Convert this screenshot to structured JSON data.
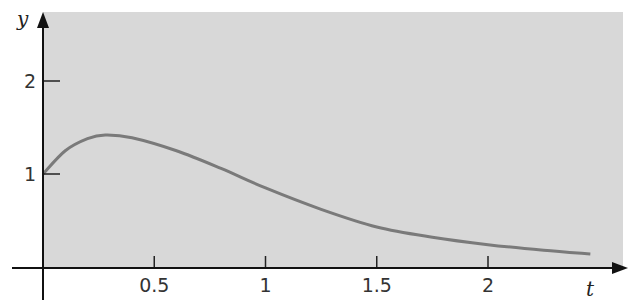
{
  "chart_data": {
    "type": "line",
    "title": "",
    "xlabel": "t",
    "ylabel": "y",
    "xlim": [
      0,
      2.6
    ],
    "ylim": [
      0,
      2.8
    ],
    "grid": false,
    "x_ticks": [
      "0.5",
      "1",
      "1.5",
      "2"
    ],
    "y_ticks": [
      "1",
      "2"
    ],
    "series": [
      {
        "name": "y(t)",
        "x": [
          0,
          0.1,
          0.2,
          0.28,
          0.4,
          0.6,
          0.8,
          1.0,
          1.25,
          1.5,
          1.75,
          2.0,
          2.25,
          2.46
        ],
        "values": [
          1.0,
          1.25,
          1.38,
          1.42,
          1.39,
          1.25,
          1.06,
          0.85,
          0.62,
          0.43,
          0.32,
          0.24,
          0.18,
          0.14
        ]
      }
    ],
    "background_color": "#d6d6d6",
    "line_color": "#7a7a7a"
  }
}
